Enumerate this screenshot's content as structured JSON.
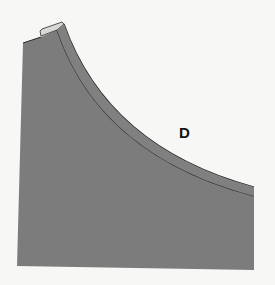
{
  "diagram": {
    "label": "D",
    "colors": {
      "background": "#f7f7f5",
      "fill": "#7c7c7c",
      "outline": "#2a2a2a"
    }
  }
}
